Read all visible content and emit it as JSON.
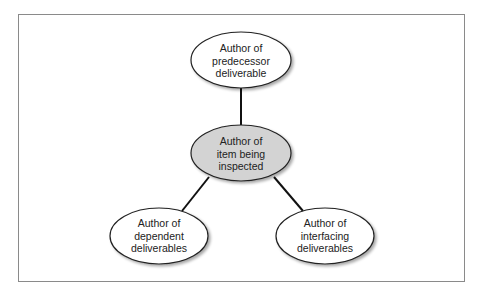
{
  "diagram": {
    "type": "relationship-diagram",
    "nodes": [
      {
        "id": "center",
        "label": "Author of item being inspected",
        "lines": [
          "Author of",
          "item being",
          "inspected"
        ],
        "fill": "#d3d3d3",
        "highlighted": true
      },
      {
        "id": "top",
        "label": "Author of predecessor deliverable",
        "lines": [
          "Author of",
          "predecessor",
          "deliverable"
        ],
        "fill": "#ffffff"
      },
      {
        "id": "bottom_left",
        "label": "Author of dependent deliverables",
        "lines": [
          "Author of",
          "dependent",
          "deliverables"
        ],
        "fill": "#ffffff"
      },
      {
        "id": "bottom_right",
        "label": "Author of interfacing deliverables",
        "lines": [
          "Author of",
          "interfacing",
          "deliverables"
        ],
        "fill": "#ffffff"
      }
    ],
    "edges": [
      {
        "from": "center",
        "to": "top"
      },
      {
        "from": "center",
        "to": "bottom_left"
      },
      {
        "from": "center",
        "to": "bottom_right"
      }
    ]
  }
}
